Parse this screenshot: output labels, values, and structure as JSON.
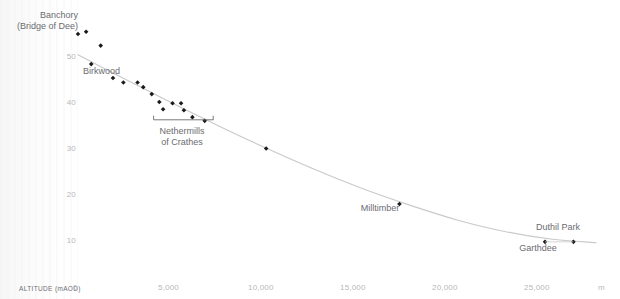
{
  "chart_data": {
    "type": "scatter",
    "title": "",
    "subtitle": "",
    "xlabel": "m",
    "ylabel": "ALTITUDE (mAOD)",
    "xlim": [
      0,
      27500
    ],
    "ylim": [
      0,
      57
    ],
    "grid": false,
    "legend_position": "none",
    "x_ticks": [
      {
        "value": 0,
        "label": "0"
      },
      {
        "value": 5000,
        "label": "5,000"
      },
      {
        "value": 10000,
        "label": "10,000"
      },
      {
        "value": 15000,
        "label": "15,000"
      },
      {
        "value": 20000,
        "label": "20,000"
      },
      {
        "value": 25000,
        "label": "25,000"
      }
    ],
    "y_ticks": [
      {
        "value": 0,
        "label": "0"
      },
      {
        "value": 10,
        "label": "10"
      },
      {
        "value": 20,
        "label": "20"
      },
      {
        "value": 30,
        "label": "30"
      },
      {
        "value": 40,
        "label": "40"
      },
      {
        "value": 50,
        "label": "50"
      }
    ],
    "series": [
      {
        "name": "Sites",
        "marker": "filled-diamond",
        "color": "#1a1a1a",
        "points": [
          {
            "x": 0,
            "y": 55.0
          },
          {
            "x": 430,
            "y": 55.5
          },
          {
            "x": 700,
            "y": 48.5
          },
          {
            "x": 1200,
            "y": 52.5
          },
          {
            "x": 1850,
            "y": 45.5
          },
          {
            "x": 2400,
            "y": 44.5
          },
          {
            "x": 3150,
            "y": 44.5
          },
          {
            "x": 3450,
            "y": 43.5
          },
          {
            "x": 3900,
            "y": 42.0
          },
          {
            "x": 4300,
            "y": 40.3
          },
          {
            "x": 4500,
            "y": 38.7
          },
          {
            "x": 5000,
            "y": 40.0
          },
          {
            "x": 5450,
            "y": 40.0
          },
          {
            "x": 5600,
            "y": 38.5
          },
          {
            "x": 6050,
            "y": 37.0
          },
          {
            "x": 6700,
            "y": 36.2
          },
          {
            "x": 9950,
            "y": 30.2
          },
          {
            "x": 17000,
            "y": 18.2
          },
          {
            "x": 24700,
            "y": 10.0
          },
          {
            "x": 26200,
            "y": 10.0
          }
        ]
      }
    ],
    "trend_line": {
      "name": "fitted profile",
      "color": "#c9c9cb",
      "points": [
        {
          "x": 0,
          "y": 50.5
        },
        {
          "x": 2500,
          "y": 45.2
        },
        {
          "x": 5000,
          "y": 40.0
        },
        {
          "x": 7500,
          "y": 35.0
        },
        {
          "x": 10000,
          "y": 30.2
        },
        {
          "x": 12500,
          "y": 25.7
        },
        {
          "x": 15000,
          "y": 21.6
        },
        {
          "x": 17500,
          "y": 18.0
        },
        {
          "x": 20000,
          "y": 14.8
        },
        {
          "x": 22500,
          "y": 12.3
        },
        {
          "x": 25000,
          "y": 10.6
        },
        {
          "x": 27400,
          "y": 9.8
        }
      ]
    },
    "annotations": [
      {
        "id": "banchory",
        "text_lines": [
          "Banchory",
          "(Bridge of Dee)"
        ],
        "align": "right",
        "anchor": {
          "x": 0,
          "y": 55.0
        }
      },
      {
        "id": "birkwood",
        "text_lines": [
          "Birkwood"
        ],
        "align": "left",
        "anchor": {
          "x": 1850,
          "y": 45.5
        }
      },
      {
        "id": "nethermills-of-crathes",
        "text_lines": [
          "Nethermills",
          "of Crathes"
        ],
        "align": "center",
        "anchor": {
          "x": 5850,
          "y": 36.0
        },
        "bracket": {
          "from_x": 4000,
          "to_x": 7150
        }
      },
      {
        "id": "milltimber",
        "text_lines": [
          "Milltimber"
        ],
        "align": "center",
        "anchor": {
          "x": 17000,
          "y": 18.2
        }
      },
      {
        "id": "duthil-park",
        "text_lines": [
          "Duthil Park"
        ],
        "align": "center",
        "anchor": {
          "x": 26200,
          "y": 10.0
        }
      },
      {
        "id": "garthdee",
        "text_lines": [
          "Garthdee"
        ],
        "align": "center",
        "anchor": {
          "x": 24700,
          "y": 10.0
        }
      }
    ]
  },
  "axes": {
    "y_caption": "ALTITUDE (mAOD)",
    "x_unit": "m",
    "y_tick_labels": [
      "50",
      "40",
      "30",
      "20",
      "10"
    ],
    "origin_label": "0",
    "x_tick_labels": [
      "5,000",
      "10,000",
      "15,000",
      "20,000",
      "25,000"
    ]
  },
  "labels": {
    "banchory_line1": "Banchory",
    "banchory_line2": "(Bridge of Dee)",
    "birkwood": "Birkwood",
    "nethermills_line1": "Nethermills",
    "nethermills_line2": "of Crathes",
    "milltimber": "Milltimber",
    "duthil_park": "Duthil Park",
    "garthdee": "Garthdee"
  },
  "colors": {
    "marker": "#1a1a1a",
    "trend": "#c9c9cb",
    "tick_text": "#b8b8bc",
    "label_text": "#6b6b6f",
    "caption_text": "#6e6e72",
    "background": "#ffffff"
  }
}
